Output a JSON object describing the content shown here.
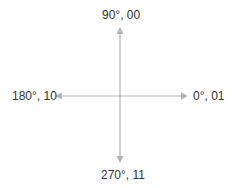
{
  "diagram": {
    "type": "phase-constellation",
    "color": "#b3b3b3",
    "labels": {
      "top": "90°, 00",
      "right": "0°, 01",
      "left": "180°, 10",
      "bottom": "270°, 11"
    }
  }
}
